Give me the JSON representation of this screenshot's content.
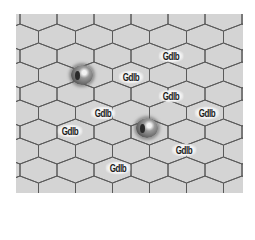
{
  "board": {
    "left": 16,
    "top": 14,
    "width": 227,
    "height": 179,
    "hex_width": 37,
    "row_step": 19,
    "side": 12,
    "tip": 7,
    "fill_color": "#d4d4d4",
    "line_color": "#5a5a5a"
  },
  "pieces": [
    {
      "name": "orb-piece-1",
      "x": 82,
      "y": 75
    },
    {
      "name": "orb-piece-2",
      "x": 147,
      "y": 128
    }
  ],
  "labels": [
    {
      "text": "Gdlb",
      "x": 171,
      "y": 56
    },
    {
      "text": "Gdlb",
      "x": 131,
      "y": 77
    },
    {
      "text": "Gdlb",
      "x": 171,
      "y": 96
    },
    {
      "text": "Gdlb",
      "x": 103,
      "y": 113
    },
    {
      "text": "Gdlb",
      "x": 207,
      "y": 113
    },
    {
      "text": "Gdlb",
      "x": 70,
      "y": 131
    },
    {
      "text": "Gdlb",
      "x": 184,
      "y": 150
    },
    {
      "text": "Gdlb",
      "x": 118,
      "y": 168
    }
  ]
}
